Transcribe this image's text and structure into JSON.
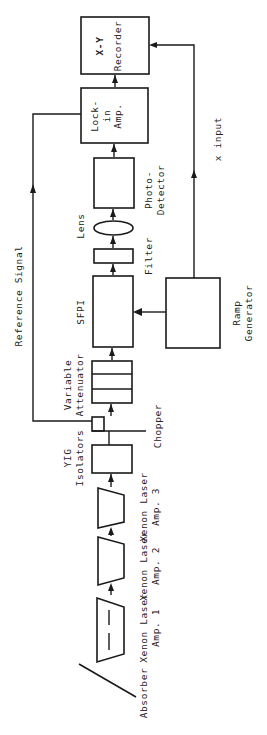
{
  "diagram": {
    "orientation": "rotated-90-ccw",
    "colors": {
      "ink": "#1a1a1a",
      "background": "#ffffff"
    },
    "labels": {
      "xy_recorder_line1": "X-Y",
      "xy_recorder_line2": "Recorder",
      "lockin_line1": "Lock-",
      "lockin_line2": "in",
      "lockin_line3": "Amp.",
      "photodetector_line1": "Photo-",
      "photodetector_line2": "Detector",
      "lens": "Lens",
      "filter": "Filter",
      "sfpi": "SFPI",
      "ramp_line1": "Ramp",
      "ramp_line2": "Generator",
      "x_input": "x input",
      "reference_signal": "Reference Signal",
      "attenuator_line1": "Variable",
      "attenuator_line2": "Attenuator",
      "chopper": "Chopper",
      "yig_line1": "YIG",
      "yig_line2": "Isolators",
      "amp3_line1": "Xenon Laser",
      "amp3_line2": "Amp.   3",
      "amp2_line1": "Xenon Laser",
      "amp2_line2": "Amp.   2",
      "amp1_line1": "Xenon Laser",
      "amp1_line2": "Amp.   1",
      "absorber": "Absorber"
    },
    "components": [
      "Absorber",
      "Xenon Laser Amp. 1",
      "Xenon Laser Amp. 2",
      "Xenon Laser Amp. 3",
      "YIG Isolators",
      "Chopper",
      "Variable Attenuator",
      "SFPI",
      "Filter",
      "Lens",
      "Photo-Detector",
      "Lock-in Amp.",
      "X-Y Recorder",
      "Ramp Generator"
    ],
    "connections": [
      {
        "from": "Xenon Laser Amp. 1",
        "to": "Xenon Laser Amp. 2"
      },
      {
        "from": "Xenon Laser Amp. 2",
        "to": "Xenon Laser Amp. 3"
      },
      {
        "from": "Xenon Laser Amp. 3",
        "to": "YIG Isolators"
      },
      {
        "from": "YIG Isolators",
        "to": "Chopper"
      },
      {
        "from": "Chopper",
        "to": "Variable Attenuator"
      },
      {
        "from": "Variable Attenuator",
        "to": "SFPI"
      },
      {
        "from": "SFPI",
        "to": "Filter"
      },
      {
        "from": "Filter",
        "to": "Lens"
      },
      {
        "from": "Lens",
        "to": "Photo-Detector"
      },
      {
        "from": "Photo-Detector",
        "to": "Lock-in Amp."
      },
      {
        "from": "Lock-in Amp.",
        "to": "X-Y Recorder"
      },
      {
        "from": "Chopper",
        "to": "Lock-in Amp.",
        "label": "Reference Signal"
      },
      {
        "from": "Ramp Generator",
        "to": "SFPI"
      },
      {
        "from": "Ramp Generator",
        "to": "X-Y Recorder",
        "label": "x input"
      }
    ]
  }
}
